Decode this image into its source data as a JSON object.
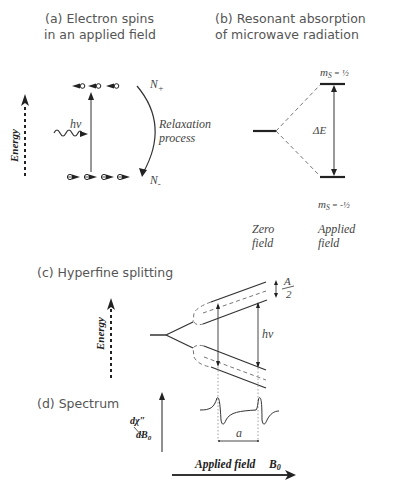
{
  "panel_a": {
    "title_line1": "(a) Electron spins",
    "title_line2": "in an applied field",
    "energy_label": "Energy",
    "hv_label": "hν",
    "n_plus": "N",
    "n_plus_sub": "+",
    "n_minus": "N",
    "n_minus_sub": "-",
    "relaxation_line1": "Relaxation",
    "relaxation_line2": "process",
    "upper_spins_count": 3,
    "lower_spins_count": 4
  },
  "panel_b": {
    "title_line1": "(b) Resonant absorption",
    "title_line2": "of microwave radiation",
    "ms_upper": "m",
    "ms_upper_sub": "S",
    "ms_upper_value": "= ½",
    "ms_lower": "m",
    "ms_lower_sub": "S",
    "ms_lower_value": "= -½",
    "delta_e": "ΔE",
    "zero_field_line1": "Zero",
    "zero_field_line2": "field",
    "applied_field_line1": "Applied",
    "applied_field_line2": "field"
  },
  "panel_c": {
    "title": "(c) Hyperfine splitting",
    "energy_label": "Energy",
    "a_half_num": "A",
    "a_half_den": "2",
    "hv_label": "hν"
  },
  "panel_d": {
    "title": "(d) Spectrum",
    "y_label_num": "dχ″",
    "y_label_den": "dB",
    "y_label_den_sub": "0",
    "spacing_label": "a",
    "x_axis_label": "Applied field",
    "x_axis_symbol": "B",
    "x_axis_symbol_sub": "0"
  }
}
